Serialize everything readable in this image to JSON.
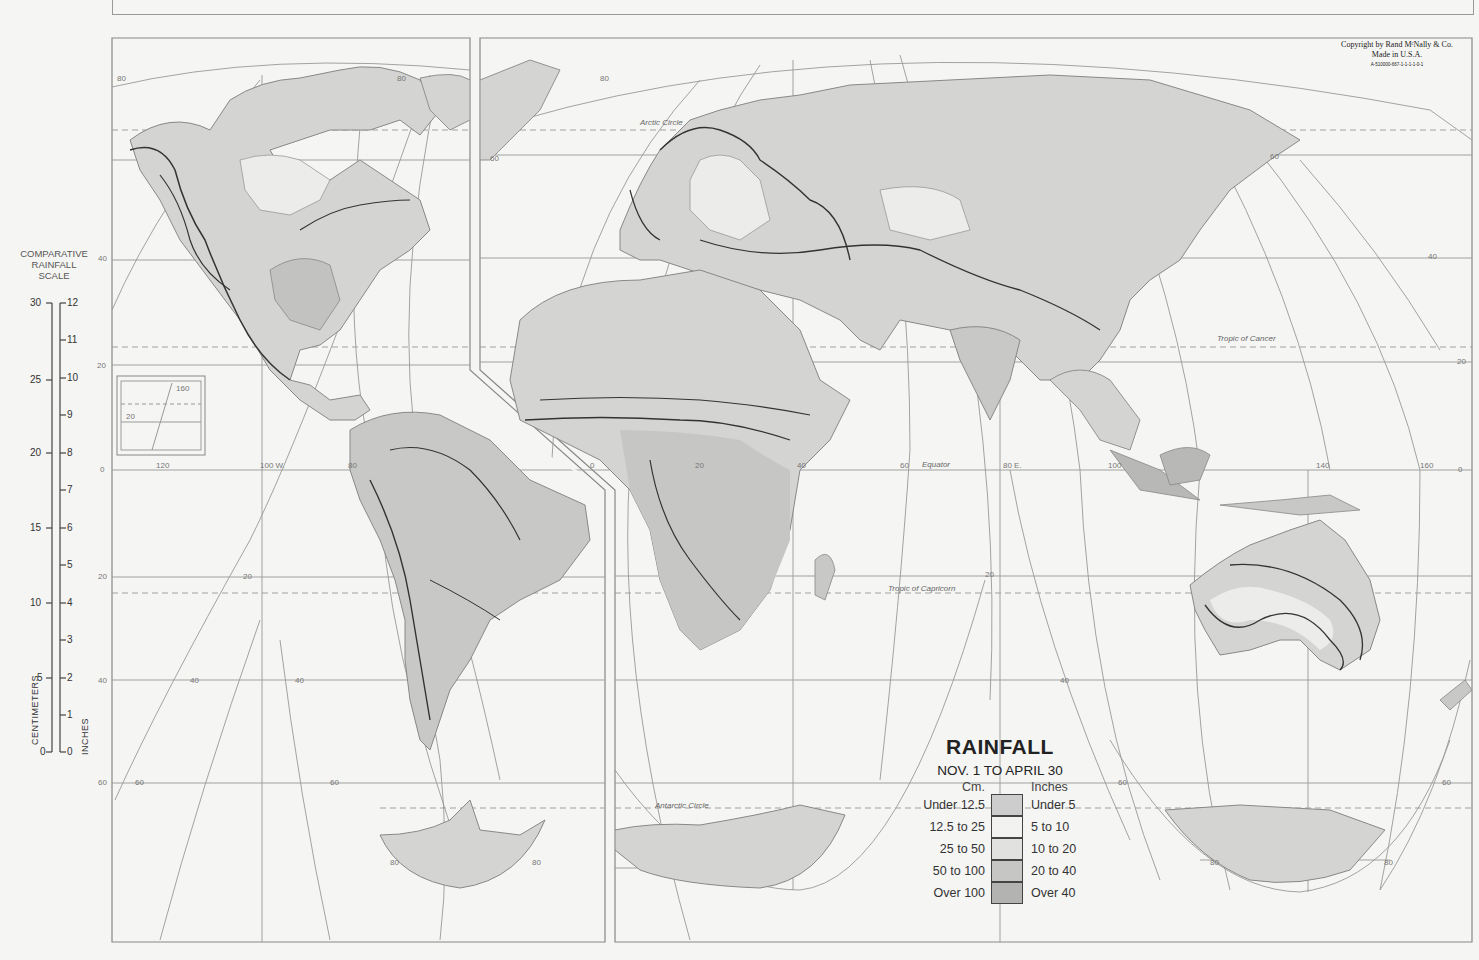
{
  "map": {
    "title": "RAINFALL",
    "subtitle": "NOV. 1 TO APRIL 30",
    "copyright": {
      "line1": "Copyright by Rand MᶜNally & Co.",
      "line2": "Made in U.S.A.",
      "code": "A-510000-667-1-1-1-1-0-1"
    },
    "colors": {
      "under_12_5": "#cdcdcd",
      "12_5_to_25": "#f2f2f0",
      "25_to_50": "#e1e1df",
      "50_to_100": "#c6c6c4",
      "over_100": "#b3b3b1",
      "land_default": "#d4d4d2",
      "graticule": "#999999",
      "background": "#f5f5f3"
    }
  },
  "legend": {
    "cm_header": "Cm.",
    "inches_header": "Inches",
    "rows": [
      {
        "cm": "Under 12.5",
        "inches": "Under 5",
        "color": "#cdcdcd"
      },
      {
        "cm": "12.5 to 25",
        "inches": "5 to 10",
        "color": "#f2f2f0"
      },
      {
        "cm": "25 to 50",
        "inches": "10 to 20",
        "color": "#e1e1df"
      },
      {
        "cm": "50 to 100",
        "inches": "20 to 40",
        "color": "#c6c6c4"
      },
      {
        "cm": "Over 100",
        "inches": "Over 40",
        "color": "#b3b3b1"
      }
    ]
  },
  "scale": {
    "title_line1": "COMPARATIVE",
    "title_line2": "RAINFALL",
    "title_line3": "SCALE",
    "cm_label": "CENTIMETERS",
    "in_label": "INCHES",
    "cm_ticks": [
      "30",
      "25",
      "20",
      "15",
      "10",
      "5",
      "0"
    ],
    "in_ticks": [
      "12",
      "11",
      "10",
      "9",
      "8",
      "7",
      "6",
      "5",
      "4",
      "3",
      "2",
      "1",
      "0"
    ]
  },
  "graticule_labels": {
    "arctic_circle": "Arctic Circle",
    "tropic_cancer": "Tropic of  Cancer",
    "equator": "Equator",
    "tropic_capricorn": "Tropic of Capricorn",
    "antarctic_circle": "Antarctic Circle",
    "lon_120": "120",
    "lon_100w": "100 W.",
    "lon_80": "80",
    "lon_60": "60",
    "lon_40": "40",
    "lon_20": "20",
    "lon_0": "0",
    "lon_80e": "80 E.",
    "lon_100": "100",
    "lon_140": "140",
    "lon_160": "160",
    "lat_80": "80",
    "lat_60": "60",
    "lat_40": "40",
    "lat_20": "20",
    "lat_0": "0"
  },
  "inset": {
    "lon": "160",
    "lat": "20"
  }
}
